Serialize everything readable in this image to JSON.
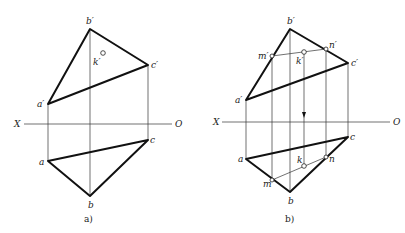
{
  "figure": {
    "panels": [
      {
        "caption": "a)",
        "axis": {
          "left_label": "X",
          "right_label": "O"
        },
        "front_view": {
          "points": {
            "a": "a′",
            "b": "b′",
            "c": "c′"
          },
          "point_k": "k′"
        },
        "top_view": {
          "points": {
            "a": "a",
            "b": "b",
            "c": "c"
          }
        }
      },
      {
        "caption": "b)",
        "axis": {
          "left_label": "X",
          "right_label": "O"
        },
        "front_view": {
          "points": {
            "a": "a′",
            "b": "b′",
            "c": "c′",
            "m": "m′",
            "n": "n′",
            "k": "k′"
          }
        },
        "top_view": {
          "points": {
            "a": "a",
            "b": "b",
            "c": "c",
            "m": "m",
            "n": "n",
            "k": "k"
          }
        }
      }
    ]
  }
}
